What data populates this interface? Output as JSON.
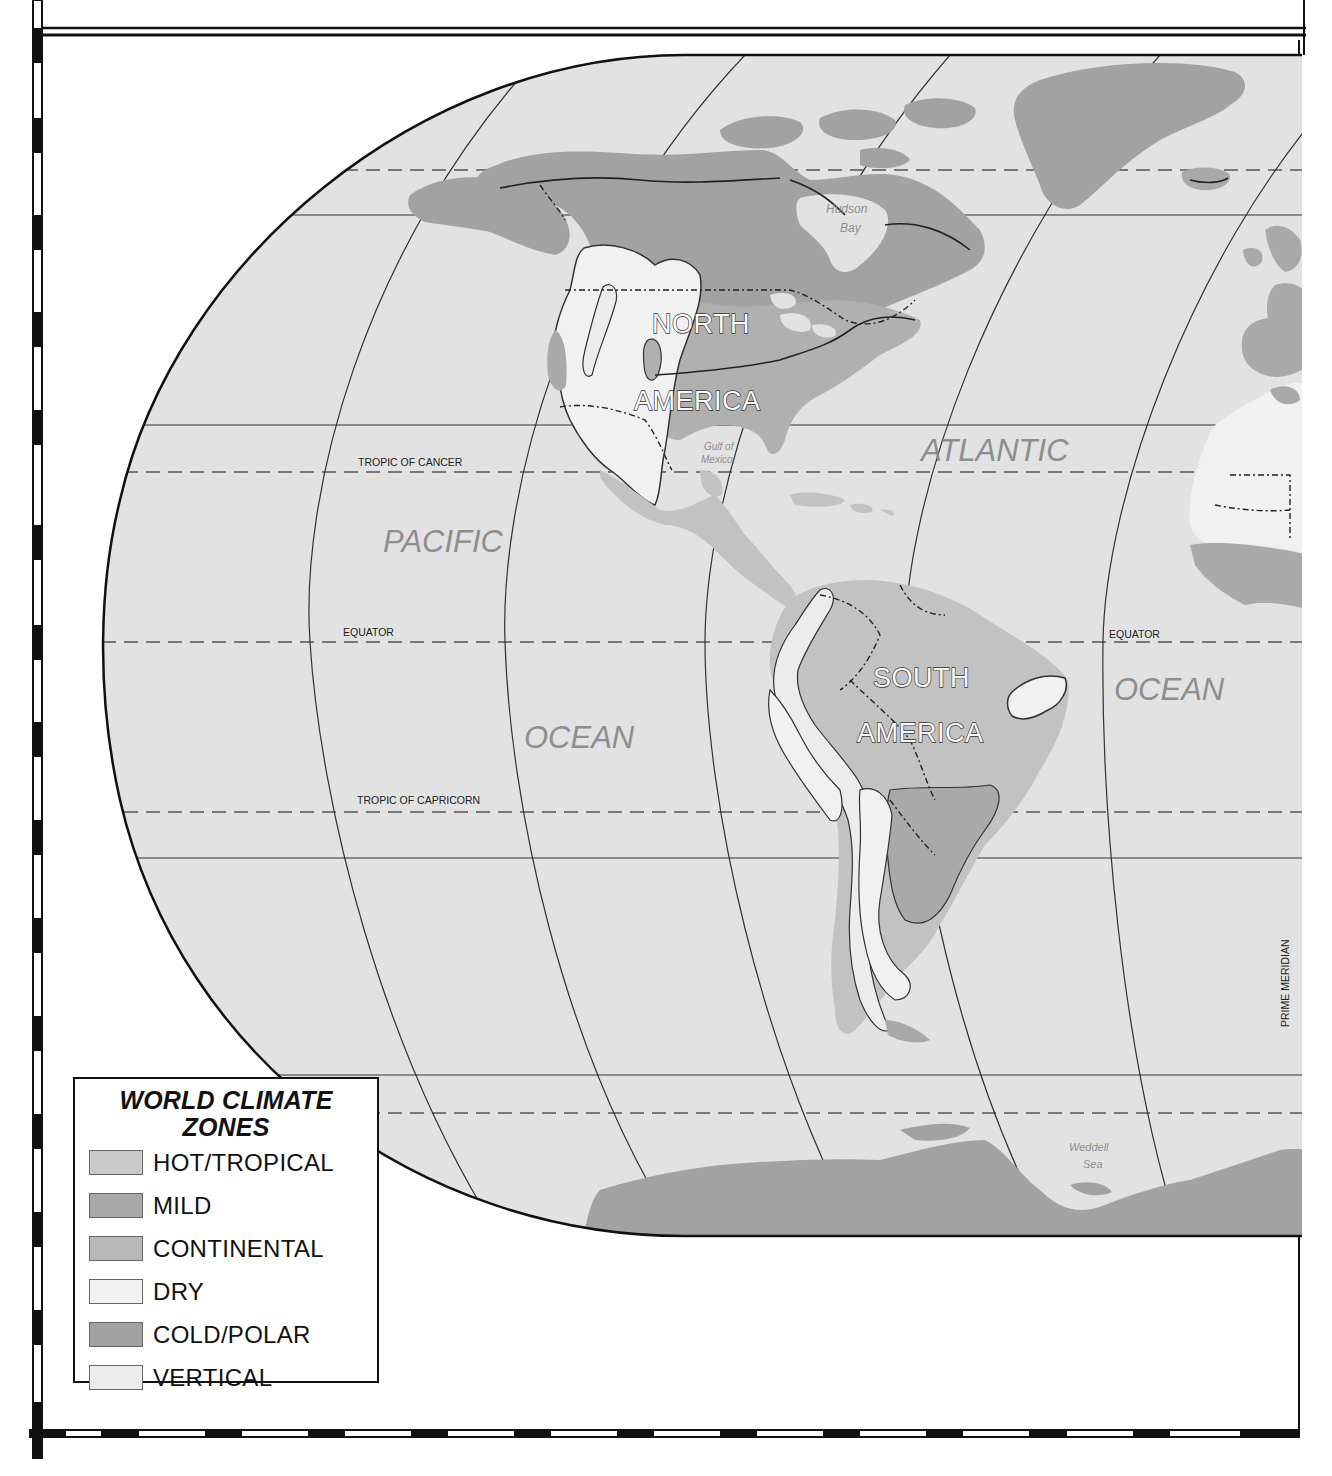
{
  "map": {
    "title": "World Climate Zones",
    "projection": "elliptical (Robinson-like), western hemisphere portion",
    "colors": {
      "ocean": "#e2e2e2",
      "hot_tropical": "#c9c9c9",
      "mild": "#a9a9a9",
      "continental": "#b8b8b8",
      "dry": "#f1f1f1",
      "cold_polar": "#a2a2a2",
      "vertical": "#ececec",
      "ocean_label": "#8e8e8e",
      "frame": "#111111"
    },
    "lines": {
      "tropic_of_cancer": "TROPIC OF CANCER",
      "equator_left": "EQUATOR",
      "equator_right": "EQUATOR",
      "tropic_of_capricorn": "TROPIC OF CAPRICORN",
      "prime_meridian": "PRIME MERIDIAN"
    },
    "ocean_labels": {
      "pacific": "PACIFIC",
      "pacific_ocean": "OCEAN",
      "atlantic": "ATLANTIC",
      "atlantic_ocean": "OCEAN"
    },
    "continent_labels": {
      "north_1": "NORTH",
      "north_2": "AMERICA",
      "south_1": "SOUTH",
      "south_2": "AMERICA"
    },
    "water_body_labels": {
      "hudson_1": "Hudson",
      "hudson_2": "Bay",
      "gulf_1": "Gulf of",
      "gulf_2": "Mexico",
      "weddell_1": "Weddell",
      "weddell_2": "Sea"
    }
  },
  "legend": {
    "title_line1": "WORLD CLIMATE",
    "title_line2": "ZONES",
    "items": [
      {
        "label": "HOT/TROPICAL",
        "color": "#c9c9c9"
      },
      {
        "label": "MILD",
        "color": "#a9a9a9"
      },
      {
        "label": "CONTINENTAL",
        "color": "#b8b8b8"
      },
      {
        "label": "DRY",
        "color": "#f1f1f1"
      },
      {
        "label": "COLD/POLAR",
        "color": "#a2a2a2"
      },
      {
        "label": "VERTICAL",
        "color": "#ececec"
      }
    ]
  }
}
